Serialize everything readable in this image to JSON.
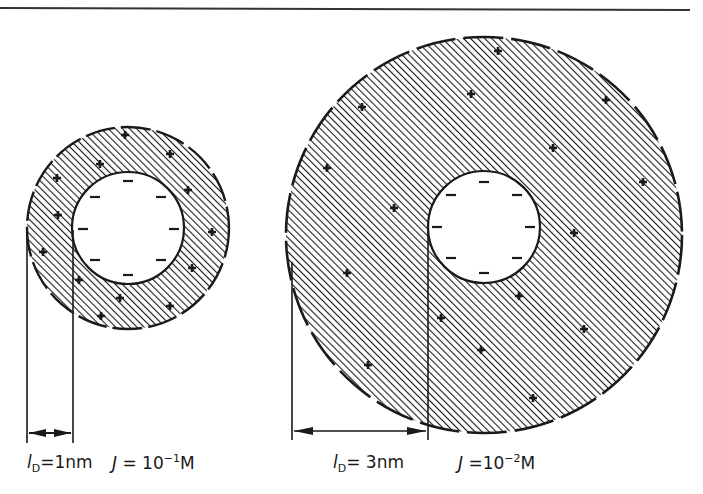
{
  "figure": {
    "colors": {
      "ink": "#1a1a1a",
      "background": "#ffffff"
    },
    "panels": [
      {
        "id": "left",
        "debye_length_symbol": "l",
        "debye_length_subscript": "D",
        "debye_length_value": "=1nm",
        "ionic_strength_symbol": "J",
        "ionic_strength_prefix": " = 10",
        "ionic_strength_exponent": "−1",
        "ionic_strength_unit": "M",
        "inner_charge": "−",
        "outer_charge": "+"
      },
      {
        "id": "right",
        "debye_length_symbol": "l",
        "debye_length_subscript": "D",
        "debye_length_value": "= 3nm",
        "ionic_strength_symbol": "J",
        "ionic_strength_prefix": " =10",
        "ionic_strength_exponent": "−2",
        "ionic_strength_unit": "M",
        "inner_charge": "−",
        "outer_charge": "+"
      }
    ]
  }
}
